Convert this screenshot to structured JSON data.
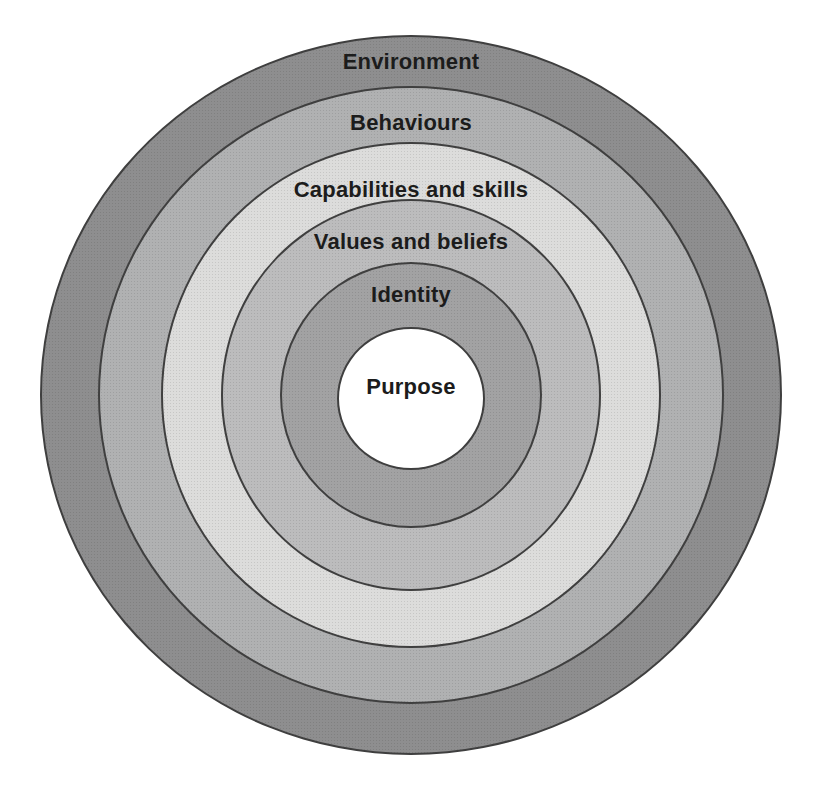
{
  "diagram": {
    "type": "concentric-levels",
    "background_color": "#ffffff",
    "outline_color": "#3f3f3f",
    "text_color": "#1c1c1c",
    "levels": [
      {
        "label": "Environment",
        "fill": "#8e8e8f"
      },
      {
        "label": "Behaviours",
        "fill": "#b0b1b2"
      },
      {
        "label": "Capabilities and skills",
        "fill": "#dcdcdb"
      },
      {
        "label": "Values and beliefs",
        "fill": "#bcbcbd"
      },
      {
        "label": "Identity",
        "fill": "#a2a2a3"
      },
      {
        "label": "Purpose",
        "fill": "#ffffff"
      }
    ]
  }
}
